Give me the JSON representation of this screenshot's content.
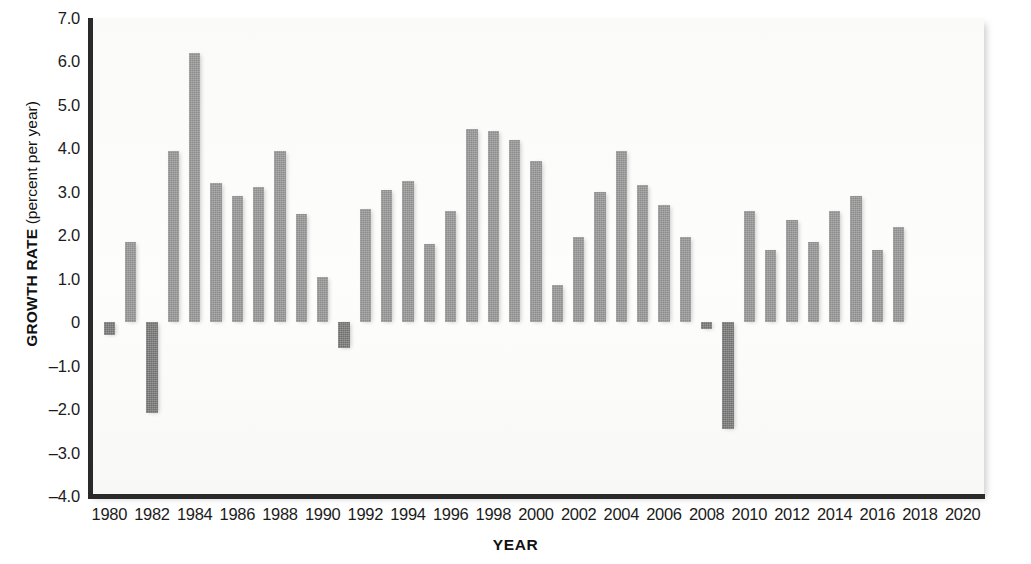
{
  "chart_data": {
    "type": "bar",
    "title": "",
    "subtitle": "",
    "xlabel": "YEAR",
    "ylabel_bold": "GROWTH RATE",
    "ylabel_regular": " (percent per year)",
    "ylabel": "GROWTH RATE (percent per year)",
    "grid": false,
    "legend": "none",
    "bar_color": "#8c8c8c",
    "negative_bar_color": "#6f6f6f",
    "background_color": "#fbfbfa",
    "axis_color": "#2a2a2a",
    "xlim": [
      1979,
      2021
    ],
    "ylim": [
      -4.0,
      7.0
    ],
    "y_ticks": [
      "7.0",
      "6.0",
      "5.0",
      "4.0",
      "3.0",
      "2.0",
      "1.0",
      "0",
      "-1.0",
      "-2.0",
      "-3.0",
      "-4.0"
    ],
    "y_tick_values": [
      7.0,
      6.0,
      5.0,
      4.0,
      3.0,
      2.0,
      1.0,
      0,
      -1.0,
      -2.0,
      -3.0,
      -4.0
    ],
    "x_ticks": [
      "1980",
      "1982",
      "1984",
      "1986",
      "1988",
      "1990",
      "1992",
      "1994",
      "1996",
      "1998",
      "2000",
      "2002",
      "2004",
      "2006",
      "2008",
      "2010",
      "2012",
      "2014",
      "2016",
      "2018",
      "2020"
    ],
    "x_tick_values": [
      1980,
      1982,
      1984,
      1986,
      1988,
      1990,
      1992,
      1994,
      1996,
      1998,
      2000,
      2002,
      2004,
      2006,
      2008,
      2010,
      2012,
      2014,
      2016,
      2018,
      2020
    ],
    "categories": [
      1980,
      1981,
      1982,
      1983,
      1984,
      1985,
      1986,
      1987,
      1988,
      1989,
      1990,
      1991,
      1992,
      1993,
      1994,
      1995,
      1996,
      1997,
      1998,
      1999,
      2000,
      2001,
      2002,
      2003,
      2004,
      2005,
      2006,
      2007,
      2008,
      2009,
      2010,
      2011,
      2012,
      2013,
      2014,
      2015,
      2016,
      2017
    ],
    "values": [
      -0.3,
      1.85,
      -2.1,
      3.95,
      6.2,
      3.2,
      2.9,
      3.1,
      3.95,
      2.5,
      1.05,
      -0.6,
      2.6,
      3.05,
      3.25,
      1.8,
      2.55,
      4.45,
      4.4,
      4.2,
      3.7,
      0.85,
      1.95,
      3.0,
      3.95,
      3.15,
      2.7,
      1.95,
      -0.15,
      -2.45,
      2.55,
      1.65,
      2.35,
      1.85,
      2.55,
      2.9,
      1.65,
      2.2
    ]
  }
}
